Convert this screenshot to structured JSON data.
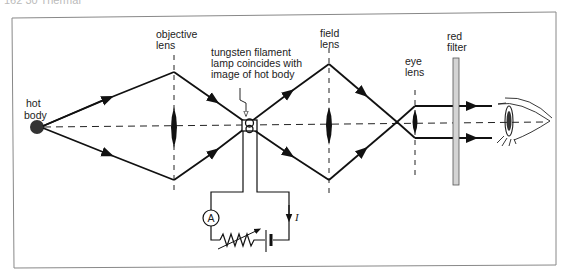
{
  "page_header": "162   30  Thermal",
  "diagram": {
    "labels": {
      "hot_body": [
        "hot",
        "body"
      ],
      "objective_lens": [
        "objective",
        "lens"
      ],
      "tungsten": [
        "tungsten filament",
        "lamp coincides with",
        "image of hot body"
      ],
      "field_lens": [
        "field",
        "lens"
      ],
      "eye_lens": [
        "eye",
        "lens"
      ],
      "red_filter": [
        "red",
        "filter"
      ],
      "ammeter": "A",
      "current": "I"
    },
    "colors": {
      "line": "#111111",
      "filter_fill": "#d4d4d4",
      "frame": "#777777",
      "hot_body": "#333333"
    }
  }
}
